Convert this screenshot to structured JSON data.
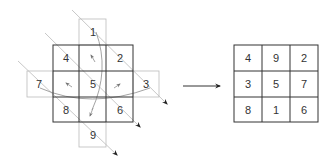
{
  "diagram": {
    "left": {
      "label": "diagonal-arrangement",
      "cells": [
        {
          "value": "1",
          "pos": "top-extension"
        },
        {
          "value": "4",
          "pos": "r0c0"
        },
        {
          "value": "2",
          "pos": "r0c2"
        },
        {
          "value": "7",
          "pos": "left-extension"
        },
        {
          "value": "5",
          "pos": "r1c1"
        },
        {
          "value": "3",
          "pos": "right-extension"
        },
        {
          "value": "8",
          "pos": "r2c0"
        },
        {
          "value": "6",
          "pos": "r2c2"
        },
        {
          "value": "9",
          "pos": "bottom-extension"
        }
      ]
    },
    "arrow": "transform-arrow",
    "right": {
      "label": "magic-square",
      "rows": [
        [
          "4",
          "9",
          "2"
        ],
        [
          "3",
          "5",
          "7"
        ],
        [
          "8",
          "1",
          "6"
        ]
      ]
    },
    "colors": {
      "grid_line": "#333333",
      "ext_line": "#bbbbbb",
      "diagonal": "#c8c8c8",
      "curve": "#999999",
      "text": "#333333"
    }
  }
}
